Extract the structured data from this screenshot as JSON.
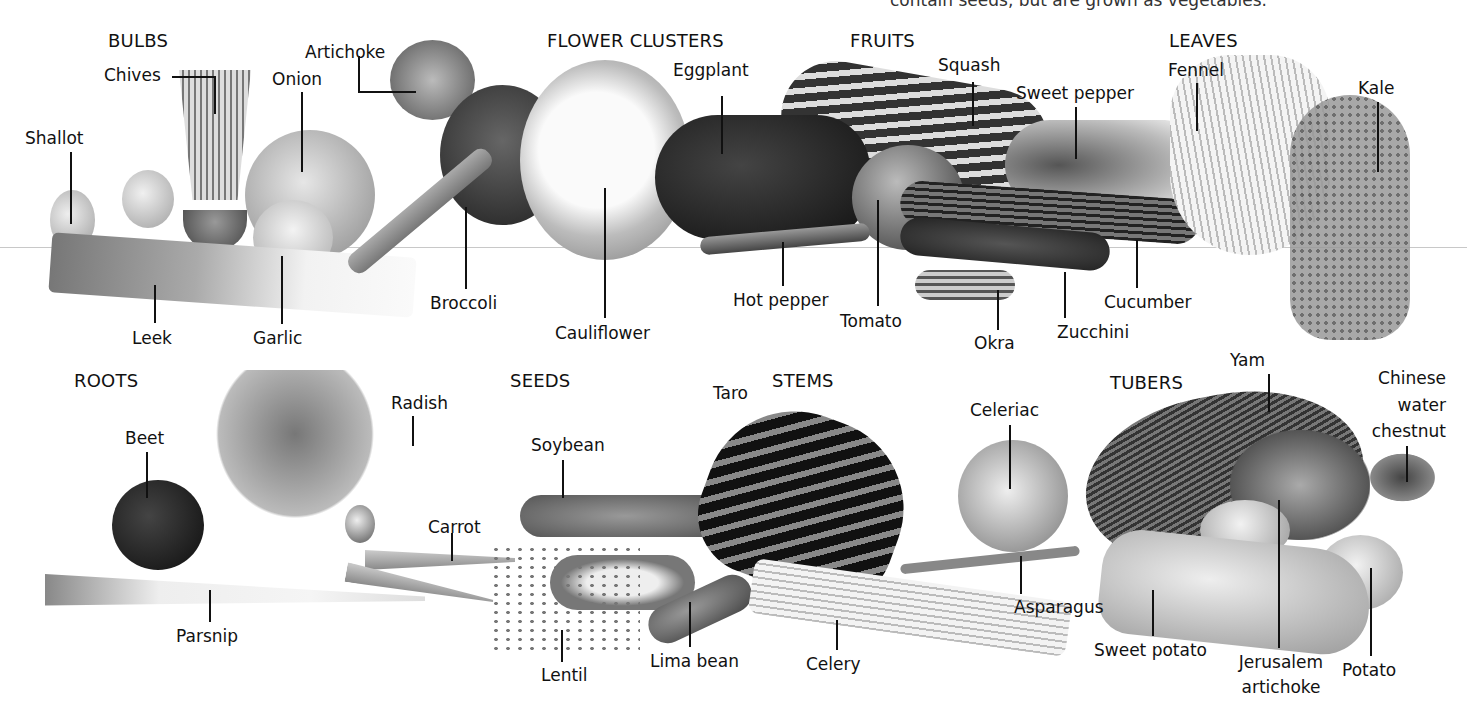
{
  "caption": "contain seeds, but are grown as vegetables.",
  "groups": {
    "bulbs": "BULBS",
    "flower_clusters": "FLOWER CLUSTERS",
    "fruits": "FRUITS",
    "leaves": "LEAVES",
    "roots": "ROOTS",
    "seeds": "SEEDS",
    "stems": "STEMS",
    "tubers": "TUBERS"
  },
  "labels": {
    "chives": "Chives",
    "artichoke": "Artichoke",
    "onion": "Onion",
    "shallot": "Shallot",
    "leek": "Leek",
    "garlic": "Garlic",
    "broccoli": "Broccoli",
    "cauliflower": "Cauliflower",
    "eggplant": "Eggplant",
    "squash": "Squash",
    "sweet_pepper": "Sweet pepper",
    "hot_pepper": "Hot pepper",
    "tomato": "Tomato",
    "okra": "Okra",
    "zucchini": "Zucchini",
    "cucumber": "Cucumber",
    "fennel": "Fennel",
    "kale": "Kale",
    "beet": "Beet",
    "radish": "Radish",
    "carrot": "Carrot",
    "parsnip": "Parsnip",
    "soybean": "Soybean",
    "lentil": "Lentil",
    "lima_bean": "Lima bean",
    "taro": "Taro",
    "celery": "Celery",
    "celeriac": "Celeriac",
    "asparagus": "Asparagus",
    "yam": "Yam",
    "chinese_water_chestnut_1": "Chinese",
    "chinese_water_chestnut_2": "water",
    "chinese_water_chestnut_3": "chestnut",
    "sweet_potato": "Sweet potato",
    "jerusalem_artichoke_1": "Jerusalem",
    "jerusalem_artichoke_2": "artichoke",
    "potato": "Potato"
  }
}
